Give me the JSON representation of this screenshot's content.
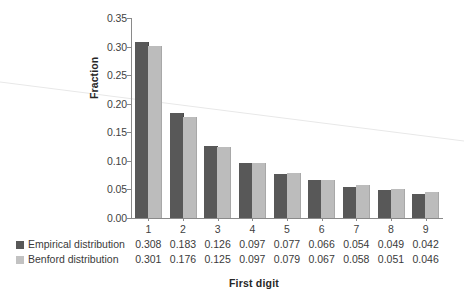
{
  "chart_data": {
    "type": "bar",
    "title": "",
    "xlabel": "First digit",
    "ylabel": "Fraction",
    "categories": [
      "1",
      "2",
      "3",
      "4",
      "5",
      "6",
      "7",
      "8",
      "9"
    ],
    "series": [
      {
        "name": "Empirical distribution",
        "color": "#585858",
        "values": [
          0.308,
          0.183,
          0.126,
          0.097,
          0.077,
          0.066,
          0.054,
          0.049,
          0.042
        ]
      },
      {
        "name": "Benford distribution",
        "color": "#c2c2c2",
        "values": [
          0.301,
          0.176,
          0.125,
          0.097,
          0.079,
          0.067,
          0.058,
          0.051,
          0.046
        ]
      }
    ],
    "ylim": [
      0.0,
      0.35
    ],
    "yticks": [
      "0.00",
      "0.05",
      "0.10",
      "0.15",
      "0.20",
      "0.25",
      "0.30",
      "0.35"
    ],
    "ytick_values": [
      0.0,
      0.05,
      0.1,
      0.15,
      0.2,
      0.25,
      0.3,
      0.35
    ],
    "grid": false,
    "legend_position": "below-axis-table",
    "data_table": {
      "rows": [
        {
          "label": "Empirical distribution",
          "swatch": "#585858",
          "cells": [
            "0.308",
            "0.183",
            "0.126",
            "0.097",
            "0.077",
            "0.066",
            "0.054",
            "0.049",
            "0.042"
          ]
        },
        {
          "label": "Benford distribution",
          "swatch": "#c2c2c2",
          "cells": [
            "0.301",
            "0.176",
            "0.125",
            "0.097",
            "0.079",
            "0.067",
            "0.058",
            "0.051",
            "0.046"
          ]
        }
      ]
    },
    "annotations": [
      {
        "name": "scan-artifact-line",
        "description": "faint light-gray diagonal line crossing the whole image"
      }
    ]
  },
  "colors": {
    "background": "#ffffff",
    "axis": "#8a8a8a",
    "text": "#3a3a3a",
    "title_text": "#262626",
    "empirical": "#585858",
    "benford": "#c2c2c2",
    "artifact": "#e6e6e6"
  }
}
